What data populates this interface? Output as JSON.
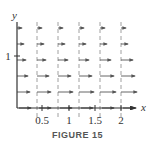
{
  "figure": {
    "caption": "FIGURE 15",
    "x_axis_label": "x",
    "y_axis_label": "y",
    "x_ticks": [
      {
        "label": "0.5",
        "px": 42
      },
      {
        "label": "1",
        "px": 69
      },
      {
        "label": "1.5",
        "px": 95
      },
      {
        "label": "2",
        "px": 121
      }
    ],
    "y_ticks": [
      {
        "label": "1",
        "py": 56
      }
    ],
    "dashed_lines_px": [
      37,
      58,
      79,
      100,
      121
    ],
    "arrow_rows_py": [
      28,
      44,
      60,
      76,
      92
    ],
    "arrow_columns_px": [
      17,
      37,
      58,
      79,
      100,
      121
    ],
    "arrow_lengths_by_row": [
      [
        5,
        5,
        5,
        5,
        5,
        5
      ],
      [
        7,
        7,
        7,
        7,
        7,
        7
      ],
      [
        9,
        9,
        10,
        10,
        11,
        12
      ],
      [
        11,
        12,
        13,
        13,
        14,
        14
      ],
      [
        13,
        14,
        15,
        15,
        16,
        16
      ]
    ],
    "colors": {
      "axis": "#333333",
      "arrow": "#555555",
      "dash": "#888888"
    }
  }
}
